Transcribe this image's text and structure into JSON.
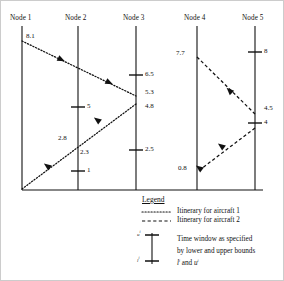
{
  "figure": {
    "type": "timeline-network-diagram"
  },
  "nodes": [
    {
      "id": "node1",
      "label": "Node 1",
      "x": 22,
      "label_x": 10,
      "ticks": []
    },
    {
      "id": "node2",
      "label": "Node 2",
      "x": 78,
      "label_x": 66,
      "ticks": [
        {
          "value": "5",
          "y": 107
        },
        {
          "value": "1",
          "y": 171
        }
      ]
    },
    {
      "id": "node3",
      "label": "Node 3",
      "x": 136,
      "label_x": 124,
      "ticks": [
        {
          "value": "6.5",
          "y": 75
        },
        {
          "value": "2.5",
          "y": 150
        }
      ]
    },
    {
      "id": "node4",
      "label": "Node 4",
      "x": 197,
      "label_x": 185,
      "ticks": []
    },
    {
      "id": "node5",
      "label": "Node 5",
      "x": 255,
      "label_x": 243,
      "ticks": [
        {
          "value": "8",
          "y": 52
        },
        {
          "value": "4",
          "y": 123
        }
      ]
    }
  ],
  "itinerary_labels": [
    {
      "text": "8.1",
      "x": 26,
      "y": 35,
      "aircraft": 1
    },
    {
      "text": "5.3",
      "x": 141,
      "y": 91,
      "aircraft": 1
    },
    {
      "text": "4.8",
      "x": 141,
      "y": 106,
      "aircraft": 1
    },
    {
      "text": "2.8",
      "x": 60,
      "y": 136,
      "aircraft": 1
    },
    {
      "text": "2.3",
      "x": 81,
      "y": 150,
      "aircraft": 1
    },
    {
      "text": "7.7",
      "x": 178,
      "y": 52,
      "aircraft": 2
    },
    {
      "text": "4.5",
      "x": 260,
      "y": 108,
      "aircraft": 2
    },
    {
      "text": "0.8",
      "x": 180,
      "y": 167,
      "aircraft": 2
    }
  ],
  "legend": {
    "title": "Legend",
    "entries": [
      {
        "style": "dotted",
        "label": "Itinerary for aircraft 1"
      },
      {
        "style": "dashed",
        "label": "Itinerary for aircraft 2"
      }
    ],
    "time_window": {
      "upper_symbol": "u",
      "upper_superscript": "i",
      "lower_symbol": "l",
      "lower_superscript": "i",
      "description_line1": "Time window as specified",
      "description_line2": "by lower and upper bounds",
      "description_line3_prefix": "l",
      "description_line3_sup1": "i",
      "description_line3_mid": " and ",
      "description_line3_suffix": "u",
      "description_line3_sup2": "i"
    }
  },
  "colors": {
    "line": "#111111",
    "background": "#ffffff"
  }
}
